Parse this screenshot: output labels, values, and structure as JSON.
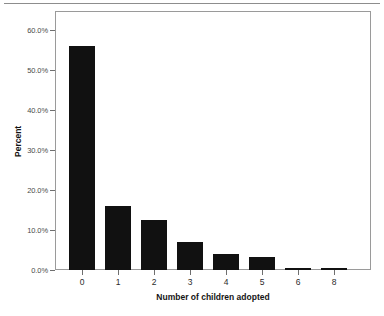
{
  "figure": {
    "background_color": "#ffffff",
    "bar_color": "#111111",
    "frame_color": "#9a9a9a",
    "axis_text_color": "#2b2b2b"
  },
  "axes": {
    "x_title": "Number of children adopted",
    "y_title": "Percent",
    "y_ticks": [
      "0.0%",
      "10.0%",
      "20.0%",
      "30.0%",
      "40.0%",
      "50.0%",
      "60.0%"
    ],
    "x_ticks": [
      "0",
      "1",
      "2",
      "3",
      "4",
      "5",
      "6",
      "8"
    ]
  },
  "chart_data": {
    "type": "bar",
    "title": "",
    "subtitle": "",
    "xlabel": "Number of children adopted",
    "ylabel": "Percent",
    "categories": [
      "0",
      "1",
      "2",
      "3",
      "4",
      "5",
      "6",
      "8"
    ],
    "values": [
      56.0,
      16.0,
      12.5,
      7.0,
      4.0,
      3.2,
      0.6,
      0.5
    ],
    "value_labels": [
      "56.0%",
      "16.0%",
      "12.5%",
      "7.0%",
      "4.0%",
      "3.2%",
      "0.6%",
      "0.5%"
    ],
    "ylim": [
      0,
      62
    ],
    "ytick_values": [
      0,
      10,
      20,
      30,
      40,
      50,
      60
    ],
    "ytick_labels": [
      "0.0%",
      "10.0%",
      "20.0%",
      "30.0%",
      "40.0%",
      "50.0%",
      "60.0%"
    ],
    "grid": false,
    "legend": null,
    "legend_position": "none",
    "series": [
      {
        "name": "Percent",
        "values": [
          56.0,
          16.0,
          12.5,
          7.0,
          4.0,
          3.2,
          0.6,
          0.5
        ]
      }
    ]
  }
}
